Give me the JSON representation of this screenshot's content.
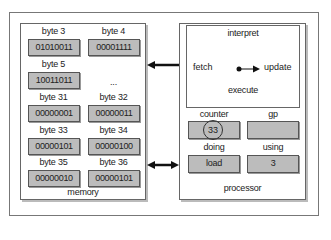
{
  "memory": {
    "label": "memory",
    "cells": [
      {
        "name": "byte 3",
        "value": "01010011"
      },
      {
        "name": "byte 4",
        "value": "00001111"
      },
      {
        "name": "byte 5",
        "value": "10011011"
      },
      {
        "name": "byte 31",
        "value": "00000001"
      },
      {
        "name": "byte 32",
        "value": "00000011"
      },
      {
        "name": "byte 33",
        "value": "00000101"
      },
      {
        "name": "byte 34",
        "value": "00000100"
      },
      {
        "name": "byte 35",
        "value": "00000010"
      },
      {
        "name": "byte 36",
        "value": "00000101"
      }
    ],
    "ellipsis": "..."
  },
  "processor": {
    "label": "processor",
    "cycle": {
      "interpret": "interpret",
      "fetch": "fetch",
      "update": "update",
      "execute": "execute"
    },
    "registers": [
      {
        "name": "counter",
        "value": "33"
      },
      {
        "name": "gp",
        "value": ""
      },
      {
        "name": "doing",
        "value": "load"
      },
      {
        "name": "using",
        "value": "3"
      }
    ]
  }
}
